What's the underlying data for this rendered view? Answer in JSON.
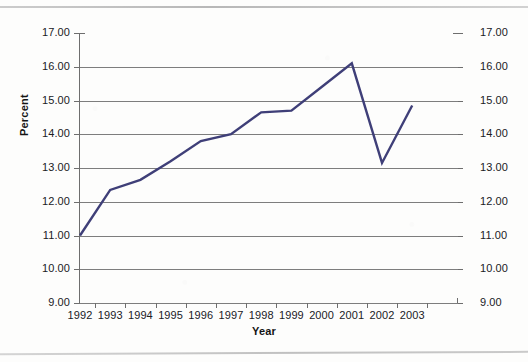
{
  "chart_data": {
    "type": "line",
    "title": "",
    "xlabel": "Year",
    "ylabel": "Percent",
    "xlim": [
      1991.5,
      2003.5
    ],
    "ylim": [
      9.0,
      17.0
    ],
    "grid": true,
    "legend": "none",
    "dual_y_axis": true,
    "line_color": "#3f3f78",
    "categories": [
      1992,
      1993,
      1994,
      1995,
      1996,
      1997,
      1998,
      1999,
      2000,
      2001,
      2002,
      2003
    ],
    "x_tick_labels": [
      "1992",
      "1993",
      "1994",
      "1995",
      "1996",
      "1997",
      "1998",
      "1999",
      "2000",
      "2001",
      "2002",
      "2003"
    ],
    "y_tick_labels": [
      "17.00",
      "16.00",
      "15.00",
      "14.00",
      "13.00",
      "12.00",
      "11.00",
      "10.00",
      "9.00"
    ],
    "y_ticks": [
      17.0,
      16.0,
      15.0,
      14.0,
      13.0,
      12.0,
      11.0,
      10.0,
      9.0
    ],
    "series": [
      {
        "name": "Percent",
        "values": [
          11.0,
          12.35,
          12.65,
          13.2,
          13.8,
          14.0,
          14.65,
          14.7,
          15.4,
          16.1,
          13.15,
          14.85
        ]
      }
    ]
  },
  "axes": {
    "y_title": "Percent",
    "x_title": "Year"
  },
  "colors": {
    "series_line": "#3f3f78",
    "gridline": "#7d7d7d",
    "axis": "#6e6e6e",
    "text": "#20201f",
    "background": "#fdfdfc"
  }
}
